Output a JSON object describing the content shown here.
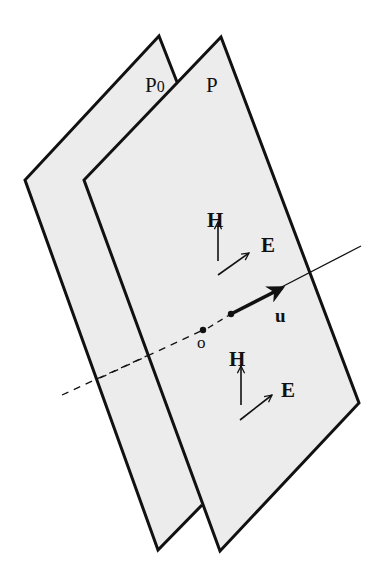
{
  "diagram": {
    "colors": {
      "plane_fill": "#ececec",
      "stroke": "#111111",
      "background": "#ffffff"
    },
    "planes": [
      {
        "id": "P0",
        "label": "P",
        "label_sub": "0"
      },
      {
        "id": "P",
        "label": "P"
      }
    ],
    "vectors": {
      "H_upper": "H",
      "E_upper": "E",
      "u": "u",
      "H_lower": "H",
      "E_lower": "E"
    },
    "points": {
      "origin": "o"
    },
    "lines": {
      "propagation_axis": "dashed behind planes, solid in front"
    }
  }
}
